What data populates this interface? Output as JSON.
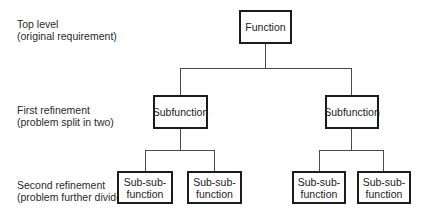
{
  "levels": [
    {
      "title": "Top level",
      "subtitle": "(original requirement)"
    },
    {
      "title": "First refinement",
      "subtitle": "(problem split in two)"
    },
    {
      "title": "Second refinement",
      "subtitle": "(problem further divided)"
    }
  ],
  "tree": {
    "root": {
      "label": "Function"
    },
    "subfunctions": [
      {
        "label": "Subfunction",
        "children": [
          {
            "line1": "Sub-sub-",
            "line2": "function"
          },
          {
            "line1": "Sub-sub-",
            "line2": "function"
          }
        ]
      },
      {
        "label": "Subfunction",
        "children": [
          {
            "line1": "Sub-sub-",
            "line2": "function"
          },
          {
            "line1": "Sub-sub-",
            "line2": "function"
          }
        ]
      }
    ]
  }
}
